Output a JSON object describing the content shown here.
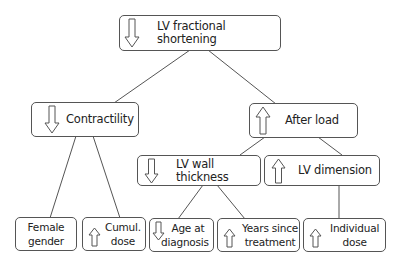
{
  "diagram": {
    "nodes": {
      "root": {
        "label": "LV fractional shortening",
        "arrow": "down"
      },
      "contractility": {
        "label": "Contractility",
        "arrow": "down"
      },
      "afterload": {
        "label": "After load",
        "arrow": "up"
      },
      "wall": {
        "label": "LV wall thickness",
        "arrow": "down"
      },
      "dimension": {
        "label": "LV dimension",
        "arrow": "up"
      },
      "female": {
        "label_line1": "Female",
        "label_line2": "gender",
        "arrow": "none"
      },
      "cumul": {
        "label_line1": "Cumul.",
        "label_line2": "dose",
        "arrow": "up"
      },
      "age": {
        "label_line1": "Age at",
        "label_line2": "diagnosis",
        "arrow": "down"
      },
      "years": {
        "label_line1": "Years since",
        "label_line2": "treatment",
        "arrow": "up"
      },
      "individual": {
        "label_line1": "Individual",
        "label_line2": "dose",
        "arrow": "up"
      }
    },
    "edges": [
      [
        "root",
        "contractility"
      ],
      [
        "root",
        "afterload"
      ],
      [
        "contractility",
        "female"
      ],
      [
        "contractility",
        "cumul"
      ],
      [
        "afterload",
        "wall"
      ],
      [
        "afterload",
        "dimension"
      ],
      [
        "wall",
        "age"
      ],
      [
        "wall",
        "years"
      ],
      [
        "dimension",
        "individual"
      ]
    ],
    "colors": {
      "stroke": "#555555",
      "text": "#222222",
      "background": "#ffffff"
    }
  }
}
